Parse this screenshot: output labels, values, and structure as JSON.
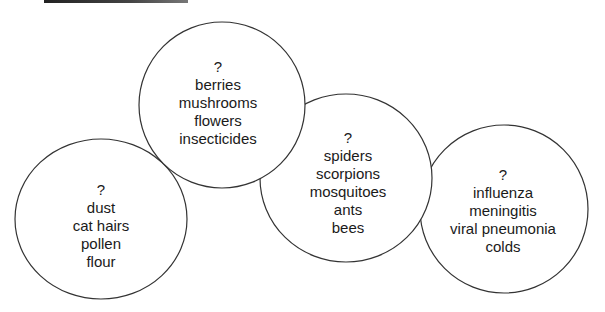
{
  "diagram": {
    "type": "bubble-groups",
    "circles": [
      {
        "id": "allergens",
        "cx": 101,
        "cy": 219,
        "rx": 86,
        "ry": 80,
        "heading": "?",
        "items": [
          "dust",
          "cat hairs",
          "pollen",
          "flour"
        ]
      },
      {
        "id": "poisons",
        "cx": 222,
        "cy": 105,
        "rx": 83,
        "ry": 83,
        "heading": "?",
        "items": [
          "berries",
          "mushrooms",
          "flowers",
          "insecticides"
        ]
      },
      {
        "id": "stinging-creatures",
        "cx": 346,
        "cy": 178,
        "rx": 86,
        "ry": 84,
        "heading": "?",
        "items": [
          "spiders",
          "scorpions",
          "mosquitoes",
          "ants",
          "bees"
        ]
      },
      {
        "id": "infections",
        "cx": 504,
        "cy": 209,
        "rx": 84,
        "ry": 84,
        "heading": "?",
        "items": [
          "influenza",
          "meningitis",
          "viral pneumonia",
          "colds"
        ]
      }
    ],
    "stroke_color": "#333333"
  }
}
